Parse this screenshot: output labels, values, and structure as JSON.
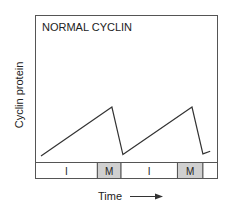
{
  "title": "NORMAL CYCLIN",
  "y_axis_label": "Cyclin protein",
  "x_axis_label": "Time",
  "colors": {
    "line": "#333333",
    "frame": "#555555",
    "mitosis_fill": "#d0d0d0",
    "interphase_fill": "#ffffff"
  },
  "phases": [
    {
      "label": "I",
      "name": "interphase",
      "start": 0.0,
      "end": 0.34
    },
    {
      "label": "M",
      "name": "mitosis",
      "start": 0.34,
      "end": 0.47
    },
    {
      "label": "I",
      "name": "interphase",
      "start": 0.47,
      "end": 0.78
    },
    {
      "label": "M",
      "name": "mitosis",
      "start": 0.78,
      "end": 0.92
    },
    {
      "label": "",
      "name": "next-interphase",
      "start": 0.92,
      "end": 1.0
    }
  ],
  "cyclin_curve": {
    "description": "Cyclin accumulates during interphase and is degraded abruptly at the end of mitosis",
    "points": [
      {
        "t": 0.03,
        "level": 0.06
      },
      {
        "t": 0.42,
        "level": 0.78
      },
      {
        "t": 0.48,
        "level": 0.08
      },
      {
        "t": 0.86,
        "level": 0.78
      },
      {
        "t": 0.92,
        "level": 0.09
      },
      {
        "t": 0.96,
        "level": 0.13
      }
    ]
  }
}
